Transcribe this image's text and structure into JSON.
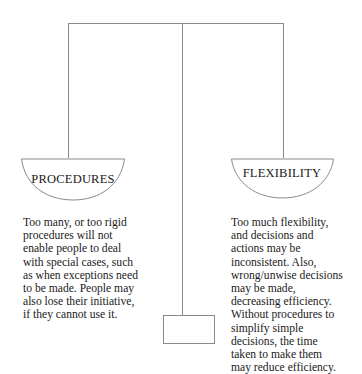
{
  "diagram": {
    "type": "balance-scale",
    "colors": {
      "line": "#8a8a8a",
      "text": "#1a1a1a",
      "background": "#ffffff"
    },
    "left_pan": {
      "label": "PROCEDURES",
      "description_lines": [
        "Too many, or too rigid",
        "procedures will not",
        "enable people to deal",
        "with special cases, such",
        "as when exceptions need",
        "to be made. People may",
        "also lose their initiative,",
        "if they cannot use it."
      ]
    },
    "right_pan": {
      "label": "FLEXIBILITY",
      "description_lines": [
        "Too much flexibility,",
        "and decisions and",
        "actions may be",
        "inconsistent. Also,",
        "wrong/unwise decisions",
        "may be made,",
        "decreasing efficiency.",
        "Without procedures to",
        "simplify simple",
        "decisions, the time",
        "taken to make them",
        "may reduce efficiency."
      ]
    }
  }
}
